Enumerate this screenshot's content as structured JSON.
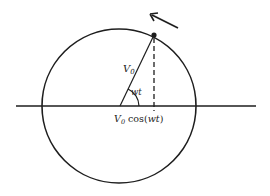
{
  "diagram": {
    "type": "phasor-rotating-vector",
    "colors": {
      "stroke": "#1e1e1e",
      "background": "#ffffff"
    },
    "circle": {
      "cx": 119,
      "cy": 106,
      "r": 77
    },
    "axis": {
      "x1": 16,
      "x2": 256,
      "y": 106
    },
    "vector": {
      "x1": 120,
      "y1": 106,
      "x2": 154,
      "y2": 35
    },
    "projection": {
      "x": 154,
      "y1": 35,
      "y2": 110,
      "style": "dashed"
    },
    "rotation_arrow": {
      "x1": 178,
      "y1": 28,
      "x2": 150,
      "y2": 14,
      "direction": "counter-clockwise"
    },
    "labels": {
      "vector_magnitude": "V",
      "vector_magnitude_sub": "0",
      "angle": "wt",
      "projection_prefix": "V",
      "projection_sub": "0",
      "projection_func": " cos(",
      "projection_arg": "wt",
      "projection_close": ")"
    }
  }
}
